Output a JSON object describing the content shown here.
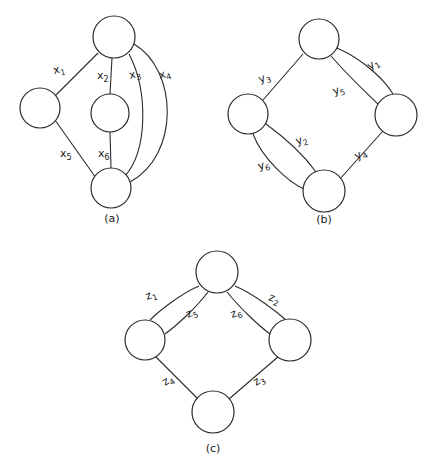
{
  "figure": {
    "title": "",
    "background_color": "#ffffff",
    "stroke_color": "#2b2b2b",
    "text_color": "#1a1a1a",
    "graphs": [
      {
        "id": "a",
        "caption": "(a)",
        "nodes": [
          {
            "name": "node-a-top",
            "cx": 114,
            "cy": 37,
            "r": 21
          },
          {
            "name": "node-a-left",
            "cx": 40,
            "cy": 108,
            "r": 20
          },
          {
            "name": "node-a-middle",
            "cx": 110,
            "cy": 113,
            "r": 19
          },
          {
            "name": "node-a-bottom",
            "cx": 111,
            "cy": 188,
            "r": 20
          }
        ],
        "edges": [
          {
            "name": "edge-x1",
            "label": "x",
            "sub": "1",
            "label_x": 54,
            "label_y": 74
          },
          {
            "name": "edge-x2",
            "label": "x",
            "sub": "2",
            "label_x": 97,
            "label_y": 79
          },
          {
            "name": "edge-x3",
            "label": "x",
            "sub": "3",
            "label_x": 130,
            "label_y": 79
          },
          {
            "name": "edge-x4",
            "label": "x",
            "sub": "4",
            "label_x": 160,
            "label_y": 79
          },
          {
            "name": "edge-x5",
            "label": "x",
            "sub": "5",
            "label_x": 60,
            "label_y": 157
          },
          {
            "name": "edge-x6",
            "label": "x",
            "sub": "6",
            "label_x": 98,
            "label_y": 157
          }
        ],
        "caption_x": 112,
        "caption_y": 222
      },
      {
        "id": "b",
        "caption": "(b)",
        "nodes": [
          {
            "name": "node-b-top",
            "cx": 319,
            "cy": 39,
            "r": 20
          },
          {
            "name": "node-b-left",
            "cx": 248,
            "cy": 114,
            "r": 20
          },
          {
            "name": "node-b-right",
            "cx": 396,
            "cy": 115,
            "r": 21
          },
          {
            "name": "node-b-bottom",
            "cx": 324,
            "cy": 191,
            "r": 21
          }
        ],
        "edges": [
          {
            "name": "edge-y1",
            "label": "y",
            "sub": "1",
            "label_x": 370,
            "label_y": 70
          },
          {
            "name": "edge-y2",
            "label": "y",
            "sub": "2",
            "label_x": 297,
            "label_y": 145
          },
          {
            "name": "edge-y3",
            "label": "y",
            "sub": "3",
            "label_x": 260,
            "label_y": 83
          },
          {
            "name": "edge-y4",
            "label": "y",
            "sub": "4",
            "label_x": 357,
            "label_y": 160
          },
          {
            "name": "edge-y5",
            "label": "y",
            "sub": "5",
            "label_x": 334,
            "label_y": 95
          },
          {
            "name": "edge-y6",
            "label": "y",
            "sub": "6",
            "label_x": 259,
            "label_y": 170
          }
        ],
        "caption_x": 324,
        "caption_y": 223
      },
      {
        "id": "c",
        "caption": "(c)",
        "nodes": [
          {
            "name": "node-c-top",
            "cx": 217,
            "cy": 272,
            "r": 21
          },
          {
            "name": "node-c-left",
            "cx": 145,
            "cy": 340,
            "r": 20
          },
          {
            "name": "node-c-right",
            "cx": 290,
            "cy": 340,
            "r": 21
          },
          {
            "name": "node-c-bottom",
            "cx": 213,
            "cy": 412,
            "r": 21
          }
        ],
        "edges": [
          {
            "name": "edge-z1",
            "label": "z",
            "sub": "1",
            "label_x": 147,
            "label_y": 300
          },
          {
            "name": "edge-z2",
            "label": "z",
            "sub": "2",
            "label_x": 268,
            "label_y": 300
          },
          {
            "name": "edge-z3",
            "label": "z",
            "sub": "3",
            "label_x": 256,
            "label_y": 386
          },
          {
            "name": "edge-z4",
            "label": "z",
            "sub": "4",
            "label_x": 165,
            "label_y": 386
          },
          {
            "name": "edge-z5",
            "label": "z",
            "sub": "5",
            "label_x": 188,
            "label_y": 318
          },
          {
            "name": "edge-z6",
            "label": "z",
            "sub": "6",
            "label_x": 232,
            "label_y": 318
          }
        ],
        "caption_x": 213,
        "caption_y": 452
      }
    ]
  }
}
